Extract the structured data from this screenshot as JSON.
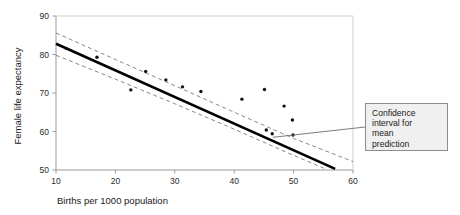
{
  "chart_data": {
    "type": "scatter",
    "title": "",
    "xlabel": "Births per 1000 population",
    "ylabel": "Female life expectancy",
    "xlim": [
      10,
      60
    ],
    "ylim": [
      50,
      90
    ],
    "xticks": [
      10,
      20,
      30,
      40,
      50,
      60
    ],
    "yticks": [
      50,
      60,
      70,
      80,
      90
    ],
    "grid": false,
    "legend": null,
    "points": [
      {
        "x": 11.7,
        "y": 81.6
      },
      {
        "x": 16.9,
        "y": 79.3
      },
      {
        "x": 22.6,
        "y": 70.8
      },
      {
        "x": 25.1,
        "y": 75.6
      },
      {
        "x": 28.5,
        "y": 73.4
      },
      {
        "x": 31.3,
        "y": 71.6
      },
      {
        "x": 34.4,
        "y": 70.4
      },
      {
        "x": 41.3,
        "y": 68.4
      },
      {
        "x": 45.1,
        "y": 70.9
      },
      {
        "x": 45.4,
        "y": 60.4
      },
      {
        "x": 46.4,
        "y": 59.4
      },
      {
        "x": 48.4,
        "y": 66.6
      },
      {
        "x": 49.8,
        "y": 63.0
      },
      {
        "x": 49.9,
        "y": 59.1
      }
    ],
    "fit_line": {
      "name": "least squares fit",
      "style": "solid",
      "x_start": 10.0,
      "y_start": 82.8,
      "x_end": 57.0,
      "y_end": 50.3
    },
    "confidence_band": {
      "name": "confidence interval for mean prediction",
      "style": "dashed",
      "upper": [
        {
          "x": 10.0,
          "y": 85.6
        },
        {
          "x": 20.0,
          "y": 78.7
        },
        {
          "x": 30.0,
          "y": 71.9
        },
        {
          "x": 40.0,
          "y": 65.0
        },
        {
          "x": 50.0,
          "y": 58.2
        },
        {
          "x": 60.0,
          "y": 52.2
        }
      ],
      "lower": [
        {
          "x": 10.0,
          "y": 79.8
        },
        {
          "x": 20.0,
          "y": 73.6
        },
        {
          "x": 30.0,
          "y": 67.2
        },
        {
          "x": 40.0,
          "y": 60.6
        },
        {
          "x": 50.0,
          "y": 53.8
        },
        {
          "x": 55.5,
          "y": 50.2
        }
      ]
    },
    "annotations": [
      {
        "name": "confidence-interval-callout",
        "text": "Confidence interval for mean prediction",
        "lines": [
          "Confidence",
          "interval for",
          "mean",
          "prediction"
        ],
        "target_x": 46.5,
        "target_y": 58.5
      }
    ],
    "colors": {
      "axis": "#9a9a9a",
      "fit_line": "#000000",
      "band": "#7a7a7a",
      "point": "#111111",
      "callout_fill": "#f0f0f0",
      "callout_border": "#8c8c8c",
      "text": "#1a1a1a",
      "background": "#ffffff"
    }
  }
}
